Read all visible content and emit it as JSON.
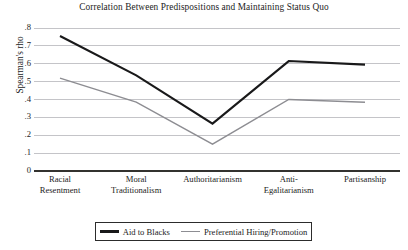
{
  "chart_data": {
    "type": "line",
    "title": "Correlation Between Predispositions and Maintaining Status Quo",
    "xlabel": "",
    "ylabel": "Spearman's rho",
    "categories": [
      "Racial Resentment",
      "Moral Traditionalism",
      "Authoritarianism",
      "Anti-Egalitarianism",
      "Partisanship"
    ],
    "category_lines": [
      [
        "Racial",
        "Resentment"
      ],
      [
        "Moral",
        "Traditionalism"
      ],
      [
        "Authoritarianism",
        ""
      ],
      [
        "Anti-",
        "Egalitarianism"
      ],
      [
        "Partisanship",
        ""
      ]
    ],
    "series": [
      {
        "name": "Aid to Blacks",
        "color": "#19191a",
        "width": 2.1,
        "values": [
          0.755,
          0.535,
          0.265,
          0.615,
          0.595
        ]
      },
      {
        "name": "Preferential Hiring/Promotion",
        "color": "#8d8d92",
        "width": 1.4,
        "values": [
          0.52,
          0.385,
          0.15,
          0.4,
          0.385
        ]
      }
    ],
    "ylim": [
      0,
      0.8
    ],
    "ytick_values": [
      0.8,
      0.7,
      0.6,
      0.5,
      0.4,
      0.3,
      0.2,
      0.1,
      0
    ],
    "ytick_labels": [
      ".8",
      ".7",
      ".6",
      ".5",
      ".4",
      ".3",
      ".2",
      ".1",
      "0"
    ],
    "grid": true,
    "legend_position": "bottom"
  },
  "legend": {
    "entries": [
      {
        "label": "Aid to Blacks"
      },
      {
        "label": "Preferential Hiring/Promotion"
      }
    ]
  }
}
